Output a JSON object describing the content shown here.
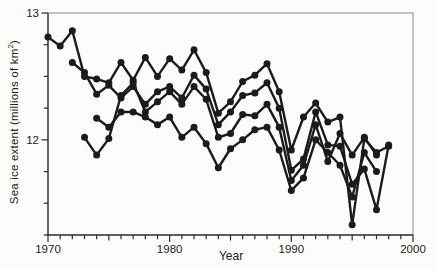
{
  "colors": {
    "background": "#fcfcfa",
    "axis": "#2a2a2a",
    "frame": "#8a8a8a",
    "line": "#1b1b1b",
    "text": "#232323"
  },
  "chart_data": {
    "type": "line",
    "title": "",
    "xlabel": "Year",
    "ylabel": "Sea ice extent (millions of km²)",
    "ylabel_prefix": "Sea ice extent (millions of km",
    "ylabel_sup": "2",
    "ylabel_suffix": ")",
    "xlim": [
      1970,
      2000
    ],
    "ylim": [
      11.25,
      13
    ],
    "x_major_ticks": [
      1970,
      1980,
      1990,
      2000
    ],
    "x_tick_labels": [
      "1970",
      "1980",
      "1990",
      "2000"
    ],
    "x_minor_tick_step_years": 1,
    "y_major_ticks": [
      13,
      12
    ],
    "y_tick_labels": [
      "13",
      "12"
    ],
    "y_minor_tick_step": 0.25,
    "grid": false,
    "legend": "none",
    "marker": "filled-circle",
    "series": [
      {
        "start_year": 1970,
        "values": [
          12.81,
          12.74,
          12.86,
          12.5,
          12.48,
          12.45,
          12.61,
          12.47,
          12.65,
          12.5,
          12.64,
          12.55,
          12.71,
          12.53,
          12.21,
          12.3,
          12.46,
          12.51,
          12.6,
          12.38,
          11.92,
          12.18,
          12.29,
          12.14,
          12.18,
          11.33,
          12.01,
          11.9,
          11.95
        ]
      },
      {
        "start_year": 1972,
        "values": [
          12.61,
          12.53,
          12.36,
          12.43,
          12.33,
          12.42,
          12.28,
          12.38,
          12.42,
          12.33,
          12.51,
          12.4,
          12.12,
          12.22,
          12.35,
          12.37,
          12.45,
          12.25,
          11.76,
          11.85,
          12.22,
          11.96,
          11.95,
          11.65,
          11.77,
          11.45,
          11.96
        ]
      },
      {
        "start_year": 1973,
        "values": [
          12.02,
          11.88,
          12.01,
          12.35,
          12.45,
          12.22,
          12.3,
          12.38,
          12.28,
          12.42,
          12.32,
          12.02,
          12.05,
          12.2,
          12.19,
          12.28,
          12.1,
          11.68,
          11.8,
          12.12,
          11.83,
          12.05,
          11.88,
          12.02,
          11.88
        ]
      },
      {
        "start_year": 1974,
        "values": [
          12.17,
          12.1,
          12.22,
          12.22,
          12.18,
          12.12,
          12.18,
          12.02,
          12.1,
          11.97,
          11.78,
          11.93,
          12.0,
          12.08,
          12.1,
          11.92,
          11.6,
          11.7,
          12.0,
          11.9,
          11.8,
          11.55,
          11.9,
          11.75
        ]
      }
    ]
  }
}
